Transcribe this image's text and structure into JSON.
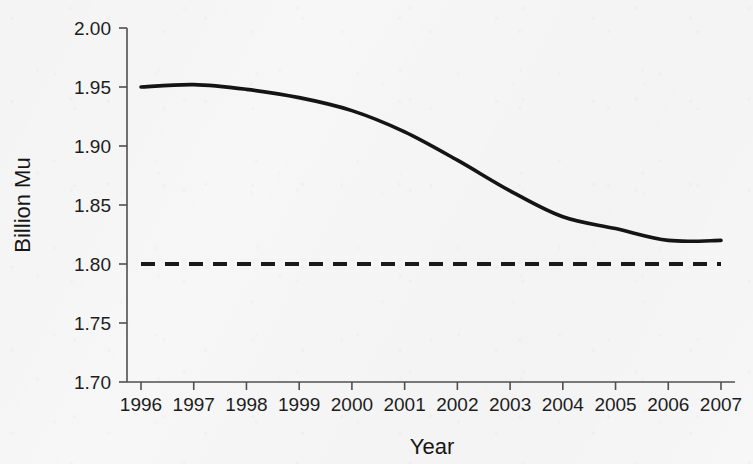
{
  "chart_data": {
    "type": "line",
    "title": "",
    "xlabel": "Year",
    "ylabel": "Billion Mu",
    "categories": [
      "1996",
      "1997",
      "1998",
      "1999",
      "2000",
      "2001",
      "2002",
      "2003",
      "2004",
      "2005",
      "2006",
      "2007"
    ],
    "x": [
      1996,
      1997,
      1998,
      1999,
      2000,
      2001,
      2002,
      2003,
      2004,
      2005,
      2006,
      2007
    ],
    "xlim": [
      1996,
      2007
    ],
    "ylim": [
      1.7,
      2.0
    ],
    "yticks": [
      1.7,
      1.75,
      1.8,
      1.85,
      1.9,
      1.95,
      2.0
    ],
    "ytick_labels": [
      "1.70",
      "1.75",
      "1.80",
      "1.85",
      "1.90",
      "1.95",
      "2.00"
    ],
    "xticks": [
      1996,
      1997,
      1998,
      1999,
      2000,
      2001,
      2002,
      2003,
      2004,
      2005,
      2006,
      2007
    ],
    "xtick_labels": [
      "1996",
      "1997",
      "1998",
      "1999",
      "2000",
      "2001",
      "2002",
      "2003",
      "2004",
      "2005",
      "2006",
      "2007"
    ],
    "grid": false,
    "legend": null,
    "series": [
      {
        "name": "Cultivated land area",
        "style": "solid",
        "color": "#141414",
        "values": [
          1.95,
          1.952,
          1.948,
          1.941,
          1.93,
          1.912,
          1.888,
          1.862,
          1.84,
          1.83,
          1.82,
          1.82
        ]
      },
      {
        "name": "Red line threshold",
        "style": "dashed",
        "color": "#1a1a1a",
        "constant": 1.8,
        "values": [
          1.8,
          1.8,
          1.8,
          1.8,
          1.8,
          1.8,
          1.8,
          1.8,
          1.8,
          1.8,
          1.8,
          1.8
        ]
      }
    ]
  },
  "colors": {
    "background": "#f7f7f7",
    "axis": "#4f4f4f",
    "text": "#1d1d1d",
    "series_solid": "#141414",
    "series_dashed": "#1a1a1a"
  }
}
